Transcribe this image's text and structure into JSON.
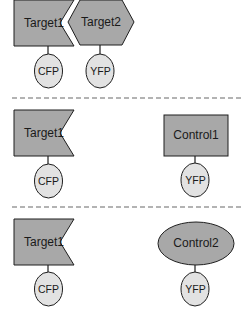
{
  "colors": {
    "shape_fill": "#a8a8a8",
    "tag_fill": "#e2e2e2",
    "stroke": "#1e1e1e",
    "divider": "#9a9a9a",
    "background": "#ffffff"
  },
  "panels": [
    {
      "nodes": [
        {
          "label": "Target1",
          "shape": "notched-rectangle",
          "tag": "CFP"
        },
        {
          "label": "Target2",
          "shape": "chevron-hexagon",
          "tag": "YFP"
        }
      ]
    },
    {
      "nodes": [
        {
          "label": "Target1",
          "shape": "notched-rectangle",
          "tag": "CFP"
        },
        {
          "label": "Control1",
          "shape": "rectangle",
          "tag": "YFP"
        }
      ]
    },
    {
      "nodes": [
        {
          "label": "Target1",
          "shape": "notched-rectangle",
          "tag": "CFP"
        },
        {
          "label": "Control2",
          "shape": "ellipse",
          "tag": "YFP"
        }
      ]
    }
  ]
}
